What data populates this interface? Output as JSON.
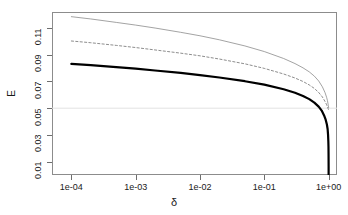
{
  "chart_data": {
    "type": "line",
    "title": "",
    "subtitle": "",
    "xlabel": "δ",
    "ylabel": "E",
    "xscale": "log",
    "yscale": "linear",
    "xlim": [
      5e-05,
      1.35
    ],
    "ylim": [
      0.0,
      0.122
    ],
    "grid": true,
    "gridlines_y": [
      0.05
    ],
    "legend": "none",
    "annotations": [],
    "xtick_labels": [
      "1e-04",
      "1e-03",
      "1e-02",
      "1e-01",
      "1e+00"
    ],
    "xtick_values": [
      0.0001,
      0.001,
      0.01,
      0.1,
      1.0
    ],
    "ytick_labels": [
      "0.01",
      "0.03",
      "0.05",
      "0.07",
      "0.09",
      "0.11"
    ],
    "ytick_values": [
      0.01,
      0.03,
      0.05,
      0.07,
      0.09,
      0.11
    ],
    "series": [
      {
        "name": "upper-thin-gray",
        "style": "solid-thin-gray",
        "color": "#8c8c8c",
        "width": 0.8,
        "x": [
          0.0001,
          0.0002,
          0.0005,
          0.001,
          0.002,
          0.005,
          0.01,
          0.02,
          0.05,
          0.1,
          0.2,
          0.3,
          0.4,
          0.5,
          0.6,
          0.7,
          0.8,
          0.88,
          0.93,
          0.96,
          0.98,
          0.99,
          1.0
        ],
        "values": [
          0.1185,
          0.1168,
          0.1142,
          0.1122,
          0.11,
          0.1068,
          0.1042,
          0.1012,
          0.0966,
          0.0924,
          0.0872,
          0.0834,
          0.0802,
          0.0772,
          0.074,
          0.0704,
          0.066,
          0.0616,
          0.0582,
          0.0556,
          0.0532,
          0.0518,
          0.0505
        ]
      },
      {
        "name": "middle-dashed-gray",
        "style": "dotted-gray",
        "color": "#707070",
        "width": 0.8,
        "x": [
          0.0001,
          0.0002,
          0.0005,
          0.001,
          0.002,
          0.005,
          0.01,
          0.02,
          0.05,
          0.1,
          0.2,
          0.3,
          0.4,
          0.5,
          0.6,
          0.7,
          0.8,
          0.88,
          0.93,
          0.96,
          0.98,
          0.99,
          1.0
        ],
        "values": [
          0.1003,
          0.099,
          0.097,
          0.0954,
          0.0936,
          0.0912,
          0.0892,
          0.0868,
          0.0832,
          0.0798,
          0.0756,
          0.0726,
          0.07,
          0.0674,
          0.0648,
          0.0618,
          0.0584,
          0.055,
          0.0526,
          0.051,
          0.0498,
          0.0492,
          0.0488
        ]
      },
      {
        "name": "lower-thick-black",
        "style": "solid-thick-black",
        "color": "#000000",
        "width": 2.2,
        "x": [
          0.0001,
          0.0002,
          0.0005,
          0.001,
          0.002,
          0.005,
          0.01,
          0.02,
          0.05,
          0.1,
          0.2,
          0.3,
          0.4,
          0.5,
          0.6,
          0.7,
          0.78,
          0.85,
          0.9,
          0.94,
          0.965,
          0.98,
          0.99,
          0.995,
          0.998,
          1.0,
          1.0
        ],
        "values": [
          0.0832,
          0.0822,
          0.0808,
          0.0796,
          0.0782,
          0.0764,
          0.0748,
          0.073,
          0.0702,
          0.0676,
          0.0642,
          0.0616,
          0.0592,
          0.0568,
          0.0542,
          0.0512,
          0.0482,
          0.0446,
          0.0414,
          0.0378,
          0.0344,
          0.0302,
          0.0252,
          0.021,
          0.015,
          0.006,
          0.0
        ]
      }
    ]
  },
  "axes": {
    "y_title": "E",
    "x_title": "δ"
  }
}
